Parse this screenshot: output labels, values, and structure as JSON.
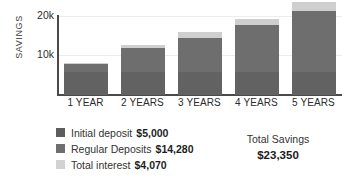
{
  "chart_data": {
    "type": "bar",
    "stacked": true,
    "title": "",
    "xlabel": "",
    "ylabel": "SAVINGS",
    "categories": [
      "1 YEAR",
      "2 YEARS",
      "3 YEARS",
      "4 YEARS",
      "5 YEARS"
    ],
    "series": [
      {
        "name": "Initial deposit",
        "color": "#626262",
        "values": [
          5000,
          5000,
          5000,
          5000,
          5000
        ]
      },
      {
        "name": "Regular Deposits",
        "color": "#6e6e6e",
        "values": [
          1600,
          5050,
          7400,
          10100,
          13100
        ]
      },
      {
        "name": "Total interest",
        "color": "#cfcfcf",
        "values": [
          250,
          850,
          1300,
          1400,
          1900
        ]
      }
    ],
    "totals": [
      6850,
      10900,
      13700,
      16500,
      20000
    ],
    "ylim": [
      0,
      20500
    ],
    "yticks": [
      10000,
      20000
    ],
    "ytick_labels": [
      "10k",
      "20k"
    ],
    "grid": true,
    "legend_position": "bottom-left"
  },
  "axis": {
    "y_title": "SAVINGS",
    "y_tick_20k": "20k",
    "y_tick_10k": "10k"
  },
  "legend": {
    "items": [
      {
        "label": "Initial deposit",
        "value": "$5,000",
        "color": "#5d5d5d"
      },
      {
        "label": "Regular Deposits",
        "value": "$14,280",
        "color": "#6e6e6e"
      },
      {
        "label": "Total interest",
        "value": "$4,070",
        "color": "#d2d2d2"
      }
    ]
  },
  "total": {
    "label": "Total Savings",
    "value": "$23,350"
  }
}
